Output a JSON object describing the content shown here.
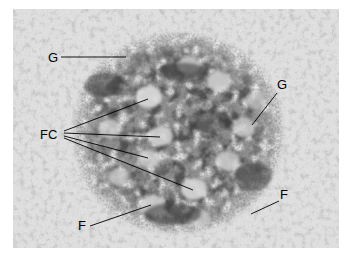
{
  "figure": {
    "type": "transmission-electron-micrograph",
    "background_color": "#ffffff",
    "plate_border_color": "#ffffff"
  },
  "micrograph": {
    "frame": {
      "x": 13,
      "y": 9,
      "width": 326,
      "height": 239
    },
    "tone": {
      "background_mean": "#d9d9d9",
      "nucleolus_mean": "#575757",
      "fibrillar_center_mean": "#d2d2d2",
      "darkest": "#2b2b2b",
      "lightest": "#f2f2f2"
    },
    "nucleolus": {
      "center_x": 172,
      "center_y": 130,
      "radius_x": 105,
      "radius_y": 100
    }
  },
  "annotations": {
    "leader_color": "#000000",
    "leader_width": 0.9,
    "labels": [
      {
        "id": "g-top-left",
        "text": "G",
        "meaning": "granular-component",
        "text_x": 48,
        "text_y": 62,
        "leaders": [
          {
            "x1": 61,
            "y1": 57,
            "x2": 126,
            "y2": 57
          }
        ]
      },
      {
        "id": "g-right",
        "text": "G",
        "meaning": "granular-component",
        "text_x": 277,
        "text_y": 89,
        "leaders": [
          {
            "x1": 277,
            "y1": 93,
            "x2": 252,
            "y2": 125
          }
        ]
      },
      {
        "id": "fc-left",
        "text": "FC",
        "meaning": "fibrillar-centers",
        "text_x": 40,
        "text_y": 139,
        "leaders": [
          {
            "x1": 64,
            "y1": 131,
            "x2": 148,
            "y2": 99
          },
          {
            "x1": 64,
            "y1": 133,
            "x2": 160,
            "y2": 137
          },
          {
            "x1": 64,
            "y1": 136,
            "x2": 148,
            "y2": 158
          },
          {
            "x1": 64,
            "y1": 138,
            "x2": 193,
            "y2": 190
          }
        ]
      },
      {
        "id": "f-bottom-left",
        "text": "F",
        "meaning": "fibrillar-component",
        "text_x": 78,
        "text_y": 230,
        "leaders": [
          {
            "x1": 90,
            "y1": 226,
            "x2": 151,
            "y2": 205
          }
        ]
      },
      {
        "id": "f-right",
        "text": "F",
        "meaning": "fibrillar-component",
        "text_x": 280,
        "text_y": 199,
        "leaders": [
          {
            "x1": 279,
            "y1": 201,
            "x2": 251,
            "y2": 214
          }
        ]
      }
    ]
  }
}
